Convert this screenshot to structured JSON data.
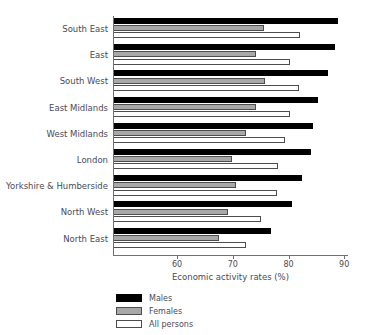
{
  "chart_data": {
    "type": "bar",
    "orientation": "horizontal",
    "title": "",
    "xlabel": "Economic activity rates (%)",
    "ylabel": "",
    "xlim": [
      48.5,
      90.5
    ],
    "xticks": [
      60,
      70,
      80,
      90
    ],
    "xtick_labels": [
      "60",
      "70",
      "80",
      "90"
    ],
    "grid": false,
    "legend_position": "bottom-left",
    "categories": [
      "South East",
      "East",
      "South West",
      "East Midlands",
      "West Midlands",
      "London",
      "Yorkshire & Humberside",
      "North West",
      "North East"
    ],
    "series": [
      {
        "name": "Males",
        "color": "#000000",
        "values": [
          88.8,
          88.4,
          87.1,
          85.3,
          84.4,
          84.0,
          82.4,
          80.7,
          76.8
        ]
      },
      {
        "name": "Females",
        "color": "#a8a8a8",
        "values": [
          75.6,
          74.2,
          75.7,
          74.2,
          72.4,
          69.9,
          70.6,
          69.1,
          67.6
        ]
      },
      {
        "name": "All persons",
        "color": "#ffffff",
        "values": [
          82.1,
          80.3,
          81.9,
          80.2,
          79.4,
          78.1,
          77.9,
          75.0,
          72.3
        ]
      }
    ]
  },
  "legend": {
    "items": [
      {
        "label": "Males"
      },
      {
        "label": "Females"
      },
      {
        "label": "All persons"
      }
    ]
  },
  "axis": {
    "x_title": "Economic activity rates (%)"
  }
}
